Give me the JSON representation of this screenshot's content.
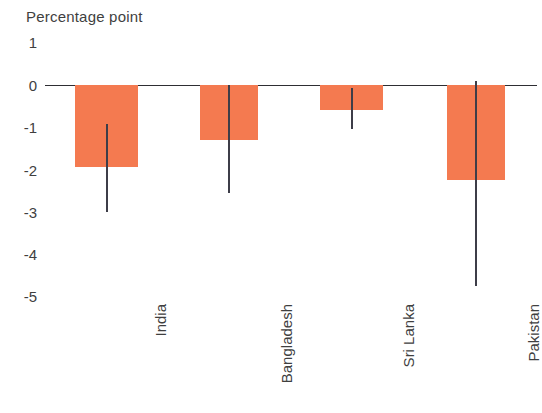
{
  "chart_data": {
    "type": "bar",
    "title": "Percentage point",
    "xlabel": "",
    "ylabel": "Percentage point",
    "ylim": [
      -5.6,
      1.3
    ],
    "yticks": [
      1,
      0,
      -1,
      -2,
      -3,
      -4,
      -5
    ],
    "ytick_labels": [
      "1",
      "0",
      "-1",
      "-2",
      "-3",
      "-4",
      "-5"
    ],
    "grid": false,
    "legend": "none",
    "bar_color": "#F47A50",
    "errorbar_color": "#3d3d48",
    "axis_color": "#2e2e33",
    "categories": [
      "India",
      "Bangladesh",
      "Sri Lanka",
      "Pakistan"
    ],
    "values": [
      -1.95,
      -1.3,
      -0.6,
      -2.25
    ],
    "series": [
      {
        "name": "Change in poverty rate",
        "values": [
          -1.95,
          -1.3,
          -0.6,
          -2.25
        ]
      }
    ],
    "error_bars": [
      {
        "category": "India",
        "low": -3.0,
        "high": -0.93
      },
      {
        "category": "Bangladesh",
        "low": -2.55,
        "high": 0.0
      },
      {
        "category": "Sri Lanka",
        "low": -1.05,
        "high": -0.07
      },
      {
        "category": "Pakistan",
        "low": -4.76,
        "high": 0.1
      }
    ]
  },
  "axis": {
    "title": "Percentage point",
    "tick_1": "1",
    "tick_0": "0",
    "tick_m1": "-1",
    "tick_m2": "-2",
    "tick_m3": "-3",
    "tick_m4": "-4",
    "tick_m5": "-5"
  },
  "categories": {
    "india": "India",
    "bangladesh": "Bangladesh",
    "sri_lanka": "Sri Lanka",
    "pakistan": "Pakistan"
  }
}
